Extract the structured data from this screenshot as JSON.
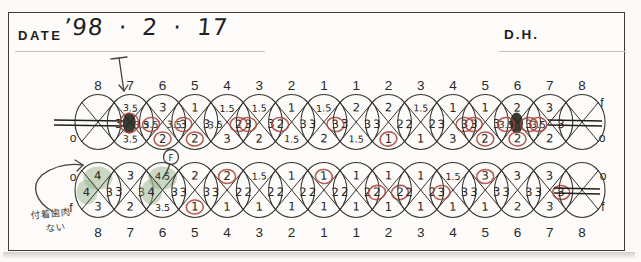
{
  "header": {
    "date_label": "DATE",
    "date_value": "’98 · 2 · 17",
    "examiner": "D.H."
  },
  "side_labels": {
    "upper_left_o": "o",
    "upper_right_f": "f",
    "upper_right_o": "o",
    "lower_left_o": "o",
    "lower_left_f": "f",
    "lower_right_o": "o",
    "lower_right_f": "f"
  },
  "tooth_numbers": [
    "8",
    "7",
    "6",
    "5",
    "4",
    "3",
    "2",
    "1",
    "1",
    "2",
    "3",
    "4",
    "5",
    "6",
    "7",
    "8"
  ],
  "upper_row": {
    "teeth": [
      {
        "missing": true,
        "strike": [
          -44,
          26
        ]
      },
      {
        "v": {
          "top": "3.5",
          "left": "3",
          "right": "3.5",
          "bottom": "3.5"
        },
        "red": [
          "center"
        ],
        "blob": true
      },
      {
        "v": {
          "top": "3",
          "left": "3.5",
          "right": "3.5",
          "bottom": "2"
        },
        "red": [
          "left",
          "bottom"
        ]
      },
      {
        "v": {
          "top": "1",
          "left": "3",
          "right": "3",
          "bottom": "2"
        },
        "red": [
          "left",
          "bottom"
        ]
      },
      {
        "v": {
          "top": "1.5",
          "left": "3.5",
          "right": "2",
          "bottom": "3"
        },
        "red": [
          "right"
        ]
      },
      {
        "v": {
          "top": "1.5",
          "left": "3",
          "right": "3",
          "bottom": "2"
        },
        "red": [
          "left"
        ]
      },
      {
        "v": {
          "top": "1",
          "left": "2",
          "right": "3",
          "bottom": "1.5"
        },
        "red": [
          "left"
        ]
      },
      {
        "v": {
          "top": "1.5",
          "left": "3",
          "right": "3",
          "bottom": "2"
        },
        "red": [
          "right"
        ]
      },
      {
        "v": {
          "top": "2",
          "left": "3",
          "right": "3",
          "bottom": "1.5"
        },
        "red": []
      },
      {
        "v": {
          "top": "2",
          "left": "3",
          "right": "2",
          "bottom": "1"
        },
        "red": [
          "bottom"
        ]
      },
      {
        "v": {
          "top": "1.5",
          "left": "2",
          "right": "2",
          "bottom": "1"
        },
        "red": []
      },
      {
        "v": {
          "top": "1",
          "left": "3",
          "right": "3",
          "bottom": "3"
        },
        "red": [
          "right"
        ]
      },
      {
        "v": {
          "top": "1",
          "left": "3",
          "right": "3",
          "bottom": "2"
        },
        "red": [
          "left",
          "bottom"
        ]
      },
      {
        "v": {
          "top": "2",
          "left": "3.5",
          "right": "3",
          "bottom": "2"
        },
        "red": [
          "left",
          "right",
          "bottom"
        ],
        "blob": true
      },
      {
        "v": {
          "top": "3",
          "left": "3.5",
          "right": "3",
          "bottom": "2"
        },
        "red": [
          "left"
        ]
      },
      {
        "missing": true,
        "strike": [
          -34,
          20
        ]
      }
    ]
  },
  "lower_row": {
    "teeth": [
      {
        "v": {
          "top": "4",
          "left": "4",
          "right": "3",
          "bottom": "3"
        },
        "green": [
          "top",
          "left"
        ]
      },
      {
        "v": {
          "top": "3",
          "left": "3",
          "right": "3",
          "bottom": "2"
        }
      },
      {
        "v": {
          "top": "4.5",
          "left": "4",
          "right": "3",
          "bottom": "3.5"
        },
        "green": [
          "top",
          "left"
        ]
      },
      {
        "v": {
          "top": "2",
          "left": "3",
          "right": "3",
          "bottom": "1"
        },
        "red": [
          "bottom"
        ]
      },
      {
        "v": {
          "top": "2",
          "left": "3",
          "right": "2",
          "bottom": "1"
        },
        "red": [
          "top"
        ]
      },
      {
        "v": {
          "top": "1.5",
          "left": "2",
          "right": "2",
          "bottom": "1"
        }
      },
      {
        "v": {
          "top": "1",
          "left": "2",
          "right": "2",
          "bottom": "1"
        }
      },
      {
        "v": {
          "top": "1",
          "left": "2",
          "right": "2",
          "bottom": "1"
        },
        "red": [
          "top"
        ]
      },
      {
        "v": {
          "top": "1",
          "left": "2",
          "right": "2",
          "bottom": "1"
        }
      },
      {
        "v": {
          "top": "1",
          "left": "2",
          "right": "2",
          "bottom": "1"
        },
        "red": [
          "left",
          "right"
        ]
      },
      {
        "v": {
          "top": "1",
          "left": "2",
          "right": "2",
          "bottom": "1"
        }
      },
      {
        "v": {
          "top": "1.5",
          "left": "3",
          "right": "3",
          "bottom": "1"
        },
        "red": [
          "left"
        ]
      },
      {
        "v": {
          "top": "3",
          "left": "3",
          "right": "3",
          "bottom": "1"
        },
        "red": [
          "top"
        ]
      },
      {
        "v": {
          "top": "3",
          "left": "3",
          "right": "3",
          "bottom": "2"
        }
      },
      {
        "v": {
          "top": "3",
          "left": "3",
          "right": "3",
          "bottom": "3"
        },
        "red": [
          "right"
        ]
      },
      {
        "missing": true,
        "strike": [
          -28,
          18
        ]
      }
    ]
  },
  "annotations": {
    "furcation_mark": "F",
    "note_line1": "付着歯肉",
    "note_line2": "ない"
  },
  "colors": {
    "red_pen": "#a84138",
    "green_marker": "#97b48c",
    "ink": "#36342f"
  }
}
